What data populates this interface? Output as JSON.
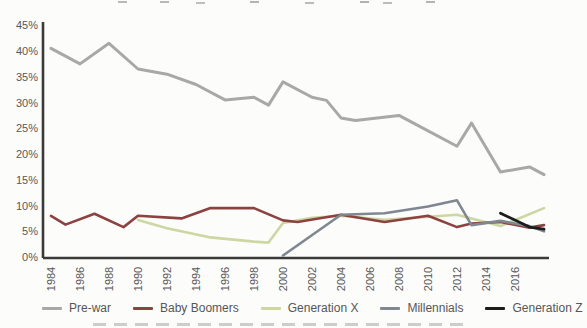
{
  "figure": {
    "background": "#fcfcfb",
    "axis_color": "#3a3a3a",
    "tick_label_color": "#585858"
  },
  "chart_data": {
    "type": "line",
    "title": "",
    "xlabel": "",
    "ylabel": "",
    "x_range": [
      1984,
      2018
    ],
    "ylim": [
      0,
      45
    ],
    "grid": false,
    "legend_position": "bottom",
    "y_ticks": [
      "0%",
      "5%",
      "10%",
      "15%",
      "20%",
      "25%",
      "30%",
      "35%",
      "40%",
      "45%"
    ],
    "x_ticks": [
      "1984",
      "1986",
      "1988",
      "1990",
      "1992",
      "1994",
      "1996",
      "1998",
      "2000",
      "2002",
      "2004",
      "2006",
      "2008",
      "2010",
      "2012",
      "2014",
      "2016"
    ],
    "series": [
      {
        "name": "Pre-war",
        "color": "#a8a8a8",
        "width": 3,
        "zorder": 1,
        "points": [
          [
            1984,
            40.5
          ],
          [
            1985,
            39
          ],
          [
            1986,
            37.5
          ],
          [
            1988,
            41.5
          ],
          [
            1990,
            36.5
          ],
          [
            1992,
            35.5
          ],
          [
            1994,
            33.5
          ],
          [
            1996,
            30.5
          ],
          [
            1998,
            31
          ],
          [
            1999,
            29.5
          ],
          [
            2000,
            34
          ],
          [
            2002,
            31
          ],
          [
            2003,
            30.4
          ],
          [
            2004,
            27
          ],
          [
            2005,
            26.5
          ],
          [
            2008,
            27.5
          ],
          [
            2009,
            26
          ],
          [
            2012,
            21.5
          ],
          [
            2013,
            26
          ],
          [
            2015,
            16.5
          ],
          [
            2017,
            17.5
          ],
          [
            2018,
            16
          ]
        ]
      },
      {
        "name": "Baby Boomers",
        "color": "#8c4240",
        "width": 2.6,
        "zorder": 3,
        "points": [
          [
            1984,
            8
          ],
          [
            1985,
            6.3
          ],
          [
            1987,
            8.4
          ],
          [
            1989,
            5.8
          ],
          [
            1990,
            8
          ],
          [
            1993,
            7.5
          ],
          [
            1995,
            9.5
          ],
          [
            1998,
            9.5
          ],
          [
            2000,
            7.1
          ],
          [
            2001,
            6.8
          ],
          [
            2004,
            8.2
          ],
          [
            2007,
            6.8
          ],
          [
            2010,
            8
          ],
          [
            2012,
            5.8
          ],
          [
            2013,
            6.5
          ],
          [
            2015,
            6.8
          ],
          [
            2017,
            5.7
          ],
          [
            2018,
            6.2
          ]
        ]
      },
      {
        "name": "Generation X",
        "color": "#ccd7a2",
        "width": 2.6,
        "zorder": 2,
        "points": [
          [
            1990,
            7.2
          ],
          [
            1992,
            5.6
          ],
          [
            1995,
            3.8
          ],
          [
            1998,
            3
          ],
          [
            1999,
            2.8
          ],
          [
            2000,
            6.6
          ],
          [
            2002,
            7.6
          ],
          [
            2004,
            8
          ],
          [
            2007,
            7.2
          ],
          [
            2012,
            8.2
          ],
          [
            2015,
            6
          ],
          [
            2018,
            9.5
          ]
        ]
      },
      {
        "name": "Millennials",
        "color": "#7f8790",
        "width": 2.6,
        "zorder": 4,
        "points": [
          [
            2000,
            0.3
          ],
          [
            2004,
            8.2
          ],
          [
            2007,
            8.5
          ],
          [
            2010,
            9.8
          ],
          [
            2012,
            11
          ],
          [
            2013,
            6.2
          ],
          [
            2015,
            7
          ],
          [
            2017,
            6
          ],
          [
            2018,
            5
          ]
        ]
      },
      {
        "name": "Generation Z",
        "color": "#1c1c1c",
        "width": 2.8,
        "zorder": 5,
        "points": [
          [
            2015,
            8.5
          ],
          [
            2017,
            5.8
          ],
          [
            2018,
            5.4
          ]
        ]
      }
    ]
  }
}
